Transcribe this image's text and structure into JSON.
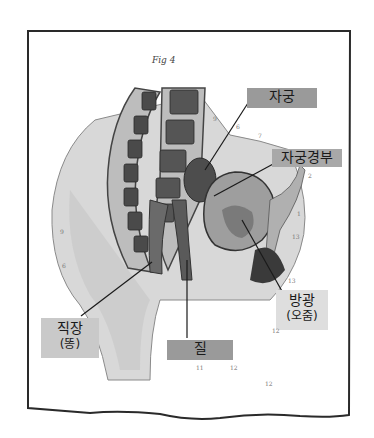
{
  "figure": {
    "title": "Fig 4"
  },
  "labels": [
    {
      "id": "uterus",
      "text": "자궁"
    },
    {
      "id": "cervix",
      "text": "자궁경부"
    },
    {
      "id": "rectum",
      "line1": "직장",
      "line2": "(똥)"
    },
    {
      "id": "vagina",
      "text": "질"
    },
    {
      "id": "bladder",
      "line1": "방광",
      "line2": "(오줌)"
    }
  ],
  "reference_numbers": [
    "9",
    "6",
    "7",
    "2",
    "1",
    "13",
    "13",
    "12",
    "11",
    "12",
    "12",
    "6",
    "9"
  ],
  "colors": {
    "frame": "#2a2a2a",
    "label_dark": "#9a9a9a",
    "label_light": "#c9c9c9",
    "ink": "#1a1a1a"
  }
}
